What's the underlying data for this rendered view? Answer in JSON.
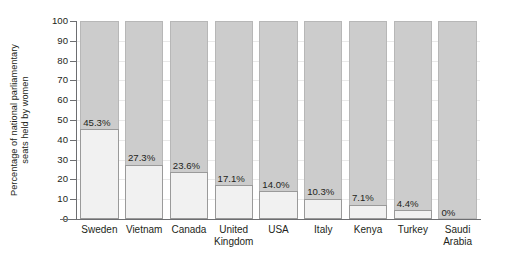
{
  "chart_data": {
    "type": "bar",
    "title": "",
    "subtitle": "",
    "xlabel": "",
    "ylabel": "Percentage of national parliamentary seats held by women",
    "ylabel_lines": [
      "Percentage of national parliamentary",
      "seats held by women"
    ],
    "categories": [
      "Sweden",
      "Vietnam",
      "Canada",
      "United Kingdom",
      "USA",
      "Italy",
      "Kenya",
      "Turkey",
      "Saudi Arabia"
    ],
    "category_lines": [
      [
        "Sweden"
      ],
      [
        "Vietnam"
      ],
      [
        "Canada"
      ],
      [
        "United",
        "Kingdom"
      ],
      [
        "USA"
      ],
      [
        "Italy"
      ],
      [
        "Kenya"
      ],
      [
        "Turkey"
      ],
      [
        "Saudi",
        "Arabia"
      ]
    ],
    "values": [
      45.3,
      27.3,
      23.6,
      17.1,
      14.0,
      10.3,
      7.1,
      4.4,
      0
    ],
    "data_labels": [
      "45.3%",
      "27.3%",
      "23.6%",
      "17.1%",
      "14.0%",
      "10.3%",
      "7.1%",
      "4.4%",
      "0%"
    ],
    "ylim": [
      0,
      100
    ],
    "ytick_values": [
      0,
      10,
      20,
      30,
      40,
      50,
      60,
      70,
      80,
      90,
      100
    ],
    "ytick_labels": [
      "0",
      "10",
      "20",
      "30",
      "40",
      "50",
      "60",
      "70",
      "80",
      "90",
      "100"
    ],
    "bar_total": 100,
    "grid": true,
    "legend": "none",
    "colors": {
      "bar_remainder": "#cccccc",
      "bar_remainder_border": "#b7b7b7",
      "bar_value": "#f1f1f1",
      "bar_value_border": "#9a9a9a",
      "axis": "#6d6e71",
      "text": "#231f20",
      "background": "#ffffff",
      "gridline": "#e9e9e9"
    }
  }
}
